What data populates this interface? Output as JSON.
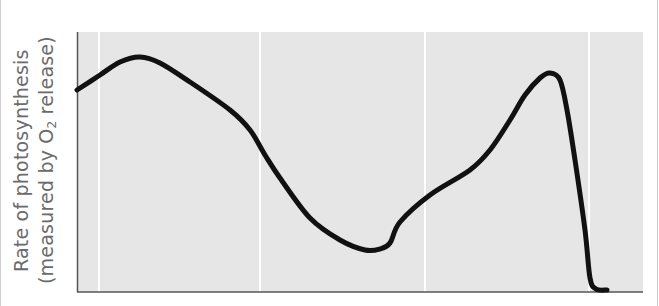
{
  "chart_data": {
    "type": "line",
    "title": "",
    "xlabel": "",
    "ylabel": "Rate of photosynthesis (measured by O2 release)",
    "ylabel_lines": [
      "Rate of photosynthesis",
      "(measured by O",
      "2",
      " release)"
    ],
    "x_ticks": [],
    "y_ticks": [],
    "grid": {
      "vertical": true,
      "horizontal": false,
      "vertical_positions_px": [
        99,
        260,
        425,
        589
      ]
    },
    "plot_area_px": {
      "left": 77,
      "top": 32,
      "right": 643,
      "bottom": 292
    },
    "series": [
      {
        "name": "Rate of photosynthesis",
        "color": "#111111",
        "points_px": [
          [
            77,
            90
          ],
          [
            100,
            75
          ],
          [
            120,
            62
          ],
          [
            140,
            57
          ],
          [
            160,
            63
          ],
          [
            190,
            82
          ],
          [
            230,
            110
          ],
          [
            250,
            130
          ],
          [
            265,
            155
          ],
          [
            280,
            178
          ],
          [
            310,
            218
          ],
          [
            340,
            240
          ],
          [
            365,
            250
          ],
          [
            380,
            249
          ],
          [
            390,
            243
          ],
          [
            400,
            222
          ],
          [
            430,
            195
          ],
          [
            470,
            170
          ],
          [
            490,
            150
          ],
          [
            510,
            120
          ],
          [
            525,
            95
          ],
          [
            540,
            78
          ],
          [
            550,
            73
          ],
          [
            560,
            80
          ],
          [
            567,
            110
          ],
          [
            575,
            160
          ],
          [
            585,
            230
          ],
          [
            590,
            278
          ],
          [
            596,
            289
          ],
          [
            607,
            290
          ]
        ],
        "relative_values_normalized": [
          0.78,
          0.84,
          0.89,
          0.91,
          0.88,
          0.81,
          0.7,
          0.62,
          0.53,
          0.44,
          0.28,
          0.2,
          0.16,
          0.16,
          0.19,
          0.27,
          0.37,
          0.47,
          0.55,
          0.66,
          0.76,
          0.83,
          0.85,
          0.82,
          0.71,
          0.51,
          0.24,
          0.06,
          0.01,
          0.0
        ]
      }
    ],
    "colors": {
      "plot_background": "#e6e6e6",
      "gridline": "#ffffff",
      "axis": "#555555",
      "curve": "#111111",
      "label_text": "#6b6b6b"
    }
  }
}
